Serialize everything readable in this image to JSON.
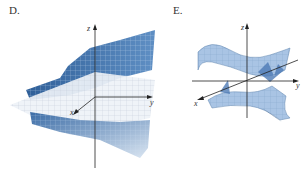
{
  "figure": {
    "panels": [
      {
        "label": "D.",
        "axes": {
          "x": "x",
          "y": "y",
          "z": "z"
        },
        "description": "Two sheet surface pieces above and below a gridded horizontal plane",
        "surface_color": "#3d6fa6",
        "plane_color": "#e8eef5"
      },
      {
        "label": "E.",
        "axes": {
          "x": "x",
          "y": "y",
          "z": "z"
        },
        "description": "Hyperbolic cylinder-like surface with two saddle-shaped sheets",
        "surface_color": "#8fb3dc"
      }
    ]
  }
}
